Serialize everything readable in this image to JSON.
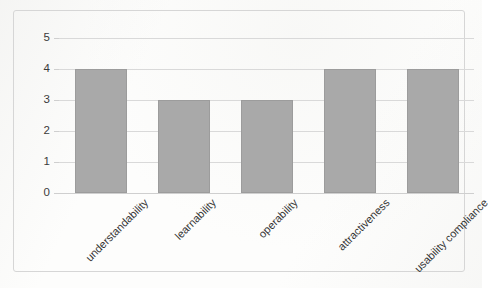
{
  "chart_data": {
    "type": "bar",
    "title": "",
    "subtitle": "",
    "xlabel": "",
    "ylabel": "",
    "categories": [
      "understandability",
      "learnability",
      "operability",
      "attractiveness",
      "usability compliance"
    ],
    "values": [
      4,
      3,
      3,
      4,
      4
    ],
    "series": [
      {
        "name": "",
        "values": [
          4,
          3,
          3,
          4,
          4
        ]
      }
    ],
    "ylim": [
      0,
      5
    ],
    "yticks": [
      "0",
      "1",
      "2",
      "3",
      "4",
      "5"
    ],
    "grid": "horizontal",
    "legend": "none",
    "bar_color": "#a9a9a9",
    "bar_border_color": "#9c9c9c",
    "gridline_color": "#d9d9d9",
    "frame_color": "#d6d6d6",
    "label_rotation": "-45",
    "background_color": "#fdfdfc"
  }
}
